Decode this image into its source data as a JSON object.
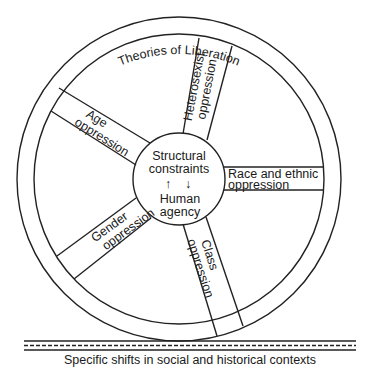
{
  "diagram": {
    "rim_label": "Theories of Liberation",
    "hub": {
      "line1": "Structural",
      "line2": "constraints",
      "arrow_up": "↑",
      "arrow_down": "↓",
      "line3": "Human",
      "line4": "agency"
    },
    "spokes": [
      {
        "id": "heterosexist",
        "line1": "Heterosexist",
        "line2": "oppression"
      },
      {
        "id": "race",
        "line1": "Race and ethnic",
        "line2": "oppression"
      },
      {
        "id": "class",
        "line1": "Class",
        "line2": "oppression"
      },
      {
        "id": "gender",
        "line1": "Gender",
        "line2": "oppression"
      },
      {
        "id": "age",
        "line1": "Age",
        "line2": "oppression"
      }
    ],
    "road_label": "Specific shifts in social and historical contexts",
    "colors": {
      "ink": "#222222",
      "background": "#ffffff"
    }
  }
}
